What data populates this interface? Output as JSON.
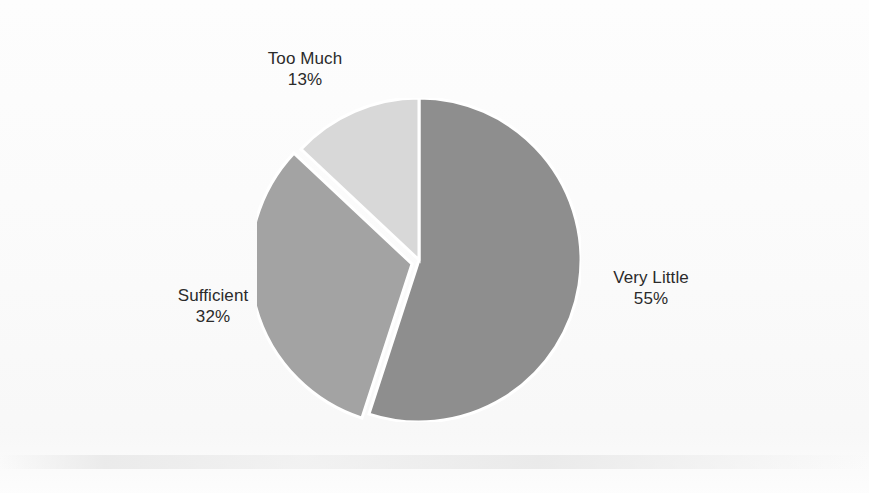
{
  "chart_data": {
    "type": "pie",
    "title": "",
    "subtitle": "",
    "xlabel": "",
    "ylabel": "",
    "legend_position": "none",
    "grid": false,
    "start_angle_deg": 0,
    "direction": "clockwise",
    "categories": [
      "Very Little",
      "Sufficient",
      "Too Much"
    ],
    "values": [
      55,
      32,
      13
    ],
    "value_unit": "%",
    "slices": [
      {
        "label": "Very Little",
        "value": 55,
        "value_text": "55%",
        "color": "#8e8e8e",
        "start_deg": 0,
        "end_deg": 198,
        "exploded": false
      },
      {
        "label": "Sufficient",
        "value": 32,
        "value_text": "32%",
        "color": "#a3a3a3",
        "start_deg": 198,
        "end_deg": 313.2,
        "exploded": true
      },
      {
        "label": "Too Much",
        "value": 13,
        "value_text": "13%",
        "color": "#d8d8d8",
        "start_deg": 313.2,
        "end_deg": 360,
        "exploded": false
      }
    ]
  },
  "labels": {
    "too_much": {
      "name": "Too Much",
      "value": "13%"
    },
    "sufficient": {
      "name": "Sufficient",
      "value": "32%"
    },
    "very_little": {
      "name": "Very Little",
      "value": "55%"
    }
  },
  "colors": {
    "background": "#fdfdfd",
    "text": "#2b2b2b",
    "separator": "#ffffff",
    "slice_very_little": "#8e8e8e",
    "slice_sufficient": "#a3a3a3",
    "slice_too_much": "#d8d8d8"
  }
}
